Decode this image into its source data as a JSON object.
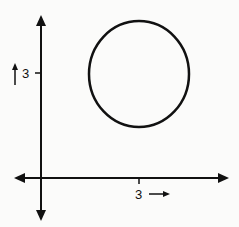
{
  "diagram": {
    "y_axis": {
      "tick_label": "3",
      "direction_arrow": "↑"
    },
    "x_axis": {
      "tick_label": "3",
      "direction_arrow": "→"
    },
    "circle": {
      "center": [
        3,
        3
      ],
      "radius_units": 1.75
    },
    "colors": {
      "stroke": "#111111",
      "background": "#fbfbfa"
    }
  }
}
